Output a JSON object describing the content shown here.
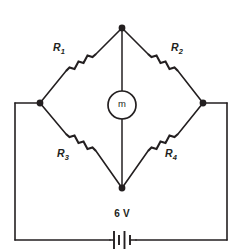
{
  "figure": {
    "kind": "wheatstone-bridge-circuit-diagram",
    "stroke_color": "#231f20",
    "background_color": "#ffffff"
  },
  "components": {
    "resistors": [
      {
        "id": "R1",
        "label": "R",
        "subscript": "1",
        "position": "upper-left-branch"
      },
      {
        "id": "R2",
        "label": "R",
        "subscript": "2",
        "position": "upper-right-branch"
      },
      {
        "id": "R3",
        "label": "R",
        "subscript": "3",
        "position": "lower-left-branch"
      },
      {
        "id": "R4",
        "label": "R",
        "subscript": "4",
        "position": "lower-right-branch"
      }
    ],
    "meter": {
      "label": "m",
      "shape": "circle",
      "position": "bridge-center"
    },
    "battery": {
      "label": "6 V",
      "voltage_value": "6",
      "voltage_unit": "V",
      "position": "bottom-outer-loop"
    }
  },
  "nodes": [
    {
      "id": "top",
      "label": "top-node"
    },
    {
      "id": "left",
      "label": "left-node"
    },
    {
      "id": "right",
      "label": "right-node"
    },
    {
      "id": "bottom",
      "label": "bottom-node"
    }
  ]
}
